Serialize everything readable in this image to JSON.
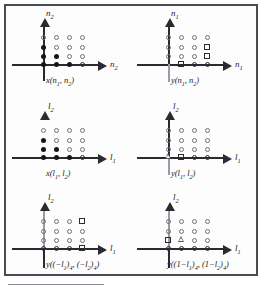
{
  "figure": {
    "panel_count": 6,
    "marker_legend": {
      "dot-filled": "filled-circle-sample",
      "dot-open": "open-circle-zero-sample",
      "square-open": "open-square-marked-sample",
      "tri-open": "open-triangle-marked-sample"
    },
    "colors": {
      "ink": "#1c1c22",
      "axis": "#2a2a30",
      "light_axis": "#9b9ba3",
      "frame": "#4a4a52",
      "paper": "#fdfdfd"
    }
  },
  "panels": [
    {
      "id": "panel-x-n1-n2",
      "caption": "x(n₁, n₂)",
      "caption_html": "x(n<sub>1</sub>, n<sub>2</sub>)",
      "axis_h_label": "n₂",
      "axis_h_label_html": "n<sub>2</sub>",
      "axis_v_label": "n₂",
      "axis_v_label_html": "n<sub>2</sub>",
      "vertical_axis_style": "full-arrow",
      "grid": [
        [
          "open",
          "open",
          "open",
          "open"
        ],
        [
          "filled",
          "open",
          "open",
          "open"
        ],
        [
          "filled",
          "filled",
          "open",
          "open"
        ],
        [
          "filled",
          "filled",
          "filled",
          "open"
        ]
      ]
    },
    {
      "id": "panel-y-n1-n2",
      "caption": "y(n₁, n₂)",
      "caption_html": "y(n<sub>1</sub>, n<sub>2</sub>)",
      "axis_h_label": "n₁",
      "axis_h_label_html": "n<sub>1</sub>",
      "axis_v_label": "n₁",
      "axis_v_label_html": "n<sub>1</sub>",
      "vertical_axis_style": "full-arrow",
      "grid": [
        [
          "open",
          "open",
          "open",
          "open"
        ],
        [
          "open",
          "open",
          "open",
          "square"
        ],
        [
          "open",
          "open",
          "open",
          "square"
        ],
        [
          "square",
          "open",
          "open",
          "open"
        ]
      ]
    },
    {
      "id": "panel-x-l1-l2",
      "caption": "x(l₁, l₂)",
      "caption_html": "x(l<sub>1</sub>, l<sub>2</sub>)",
      "axis_h_label": "l₁",
      "axis_h_label_html": "l<sub>1</sub>",
      "axis_v_label": "l₂",
      "axis_v_label_html": "l<sub>2</sub>",
      "vertical_axis_style": "arrowhead-only",
      "grid": [
        [
          "open",
          "open",
          "open",
          "open"
        ],
        [
          "filled",
          "open",
          "open",
          "open"
        ],
        [
          "filled",
          "filled",
          "open",
          "open"
        ],
        [
          "filled",
          "filled",
          "filled",
          "open"
        ]
      ]
    },
    {
      "id": "panel-y-l1-l2",
      "caption": "y(l₁, l₂)",
      "caption_html": "y(l<sub>1</sub>, l<sub>2</sub>)",
      "axis_h_label": "l₁",
      "axis_h_label_html": "l<sub>1</sub>",
      "axis_v_label": "l₂",
      "axis_v_label_html": "l<sub>2</sub>",
      "vertical_axis_style": "full-arrow",
      "grid": [
        [
          "open",
          "open",
          "open",
          "open"
        ],
        [
          "open",
          "open",
          "open",
          "open"
        ],
        [
          "open",
          "open",
          "open",
          "open"
        ],
        [
          "tri",
          "square",
          "open",
          "open"
        ]
      ]
    },
    {
      "id": "panel-y-neg-l1-neg-l2",
      "caption": "y((−l₁)₄, (−l₂)₄)",
      "caption_html": "y((−l<sub>1</sub>)<sub>4</sub>, (−l<sub>2</sub>)<sub>4</sub>)",
      "axis_h_label": "l₁",
      "axis_h_label_html": "l<sub>1</sub>",
      "axis_v_label": "l₂",
      "axis_v_label_html": "l<sub>2</sub>",
      "vertical_axis_style": "full-arrow",
      "grid": [
        [
          "open",
          "open",
          "open",
          "square"
        ],
        [
          "open",
          "open",
          "open",
          "open"
        ],
        [
          "open",
          "open",
          "open",
          "open"
        ],
        [
          "open",
          "open",
          "open",
          "square"
        ]
      ]
    },
    {
      "id": "panel-y-one-minus-l1-one-minus-l2",
      "caption": "y((1−l₁)₄, (1−l₂)₄)",
      "caption_html": "y((1−l<sub>1</sub>)<sub>4</sub>, (1−l<sub>2</sub>)<sub>4</sub>)",
      "axis_h_label": "l₁",
      "axis_h_label_html": "l<sub>1</sub>",
      "axis_v_label": "l₂",
      "axis_v_label_html": "l<sub>2</sub>",
      "vertical_axis_style": "full-arrow",
      "grid": [
        [
          "open",
          "open",
          "open",
          "open"
        ],
        [
          "open",
          "open",
          "open",
          "open"
        ],
        [
          "square",
          "tri",
          "open",
          "open"
        ],
        [
          "open",
          "open",
          "open",
          "open"
        ]
      ]
    }
  ]
}
